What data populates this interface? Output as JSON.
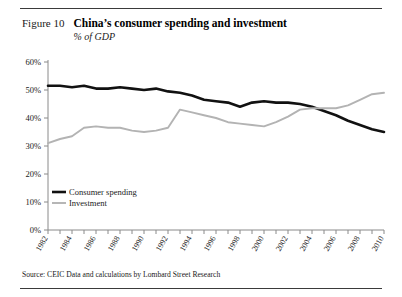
{
  "header": {
    "figure_number": "Figure 10",
    "title": "China’s consumer spending and investment",
    "subtitle": "% of GDP"
  },
  "source": "Source: CEIC Data and calculations by Lombard Street Research",
  "colors": {
    "consumer_spending": "#111111",
    "investment": "#b3b3b3",
    "axis": "#8a8a8a",
    "text": "#1a1a1a"
  },
  "legend": {
    "position": "bottom-left",
    "items": [
      {
        "label": "Consumer spending",
        "color": "#111111"
      },
      {
        "label": "Investment",
        "color": "#b3b3b3"
      }
    ]
  },
  "chart_data": {
    "type": "line",
    "title": "China’s consumer spending and investment",
    "subtitle": "% of GDP",
    "xlabel": "",
    "ylabel": "% of GDP",
    "ylim": [
      0,
      60
    ],
    "yticks": [
      0,
      10,
      20,
      30,
      40,
      50,
      60
    ],
    "ytick_labels": [
      "0%",
      "10%",
      "20%",
      "30%",
      "40%",
      "50%",
      "60%"
    ],
    "grid": false,
    "xlim": [
      1982,
      2010
    ],
    "x": [
      1982,
      1983,
      1984,
      1985,
      1986,
      1987,
      1988,
      1989,
      1990,
      1991,
      1992,
      1993,
      1994,
      1995,
      1996,
      1997,
      1998,
      1999,
      2000,
      2001,
      2002,
      2003,
      2004,
      2005,
      2006,
      2007,
      2008,
      2009,
      2010
    ],
    "xticks": [
      1982,
      1984,
      1986,
      1988,
      1990,
      1992,
      1994,
      1996,
      1998,
      2000,
      2002,
      2004,
      2006,
      2008,
      2010
    ],
    "xtick_labels": [
      "1982",
      "1984",
      "1986",
      "1988",
      "1990",
      "1992",
      "1994",
      "1996",
      "1998",
      "2000",
      "2002",
      "2004",
      "2006",
      "2008",
      "2010"
    ],
    "series": [
      {
        "name": "Consumer spending",
        "color": "#111111",
        "values": [
          51.5,
          51.5,
          51.0,
          51.5,
          50.5,
          50.5,
          51.0,
          50.5,
          50.0,
          50.5,
          49.5,
          49.0,
          48.0,
          46.5,
          46.0,
          45.5,
          44.0,
          45.5,
          46.0,
          45.5,
          45.5,
          45.0,
          44.0,
          42.5,
          41.0,
          39.0,
          37.5,
          36.0,
          35.0
        ]
      },
      {
        "name": "Investment",
        "color": "#b3b3b3",
        "values": [
          31.0,
          32.5,
          33.5,
          36.5,
          37.0,
          36.5,
          36.5,
          35.5,
          35.0,
          35.5,
          36.5,
          43.0,
          42.0,
          41.0,
          40.0,
          38.5,
          38.0,
          37.5,
          37.0,
          38.5,
          40.5,
          43.0,
          43.5,
          43.5,
          43.5,
          44.5,
          46.5,
          48.5,
          49.0
        ]
      }
    ],
    "annotations": [
      {
        "text": "lines cross around 2002-2003 near 42-43%"
      }
    ]
  }
}
